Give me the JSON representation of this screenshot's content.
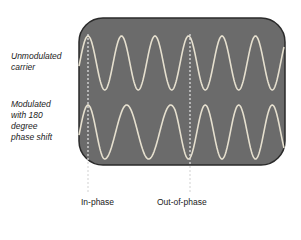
{
  "labels": {
    "unmodulated": [
      "Unmodulated",
      "carrier"
    ],
    "modulated": [
      "Modulated",
      "with 180",
      "degree",
      "phase shift"
    ],
    "in_phase": "In-phase",
    "out_of_phase": "Out-of-phase"
  },
  "colors": {
    "screen": "#6b6b6b",
    "screen_border": "#2a2a2a",
    "wave": "#e6e0cf",
    "marker": "#dcdcdc"
  },
  "waves": {
    "carrier": {
      "period_px": 33.5,
      "start_x": 79,
      "end_x": 284,
      "center_y": 63,
      "amplitude_px": 27,
      "phase_offset_x": 88
    },
    "modulated": {
      "period_px": 33.5,
      "start_x": 79,
      "end_x": 284,
      "center_y": 132,
      "amplitude_px": 27,
      "phase_offset_x": 88,
      "phase_shift_deg": 180
    }
  }
}
